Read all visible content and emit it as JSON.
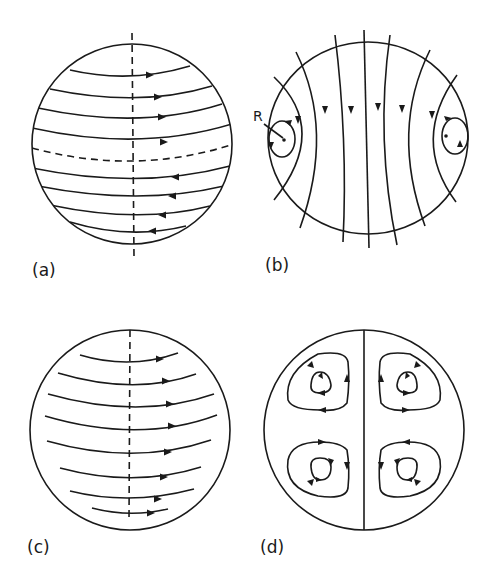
{
  "figure": {
    "panels": [
      {
        "id": "a",
        "label": "(a)",
        "description": "Sphere with dashed vertical rotation axis and dashed equator; streamlines flow eastward (right) in the northern hemisphere and westward (left) in the southern hemisphere"
      },
      {
        "id": "b",
        "label": "(b)",
        "description": "Sphere with meridional field lines extending beyond the surface, arrows pointing downward; closed loops near left and right limbs",
        "annotation": "R"
      },
      {
        "id": "c",
        "label": "(c)",
        "description": "Sphere with dashed vertical axis; all streamlines flow eastward (right)"
      },
      {
        "id": "d",
        "label": "(d)",
        "description": "Sphere divided by vertical line into four quadrants, each containing nested closed circulation cells"
      }
    ],
    "colors": {
      "ink": "#1a1a1a",
      "background": "#ffffff"
    }
  }
}
